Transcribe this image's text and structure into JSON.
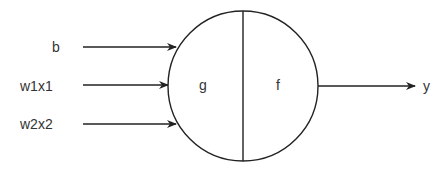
{
  "diagram": {
    "type": "perceptron",
    "inputs": [
      {
        "label": "b"
      },
      {
        "label": "w1x1"
      },
      {
        "label": "w2x2"
      }
    ],
    "node": {
      "left_label": "g",
      "right_label": "f"
    },
    "output": {
      "label": "y"
    },
    "colors": {
      "stroke": "#222222",
      "text": "#333333",
      "background": "#ffffff"
    }
  }
}
